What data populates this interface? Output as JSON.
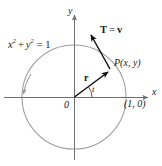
{
  "figure": {
    "background_color": "#ffffff",
    "axis_color": "#6f6f72",
    "circle_color": "#97979b",
    "vector_color": "#111111",
    "text_color": "#1a1a1a",
    "labels": {
      "y_axis": "y",
      "x_axis": "x",
      "origin": "0",
      "circle_equation_base": "x",
      "circle_equation_full": "x2 + y2 = 1",
      "circle_equation_parts": {
        "x_var": "x",
        "exp1": "2",
        "plus": "+",
        "y_var": "y",
        "exp2": "2",
        "equals": "= 1"
      },
      "tangent_vector": "T = v",
      "tangent_vector_parts": {
        "T": "T",
        "equals": "=",
        "v": "v"
      },
      "point_label": "P(x, y)",
      "point_label_parts": {
        "P": "P",
        "open": "(",
        "x": "x",
        "comma": ",",
        "y": "y",
        "close": ")"
      },
      "radius_vector": "r",
      "angle": "t",
      "unit_point": "(1, 0)"
    },
    "geometry": {
      "circle_center_x": 74,
      "circle_center_y": 97,
      "circle_radius": 52,
      "point_P_x": 110,
      "point_P_y": 70,
      "tangent_tip_x": 89,
      "tangent_tip_y": 33,
      "x_axis_start": 4,
      "x_axis_end": 151,
      "y_axis_top": 12,
      "y_axis_bottom": 160,
      "angle_degrees": 36,
      "unit_point_coords": "(1, 0)"
    }
  }
}
